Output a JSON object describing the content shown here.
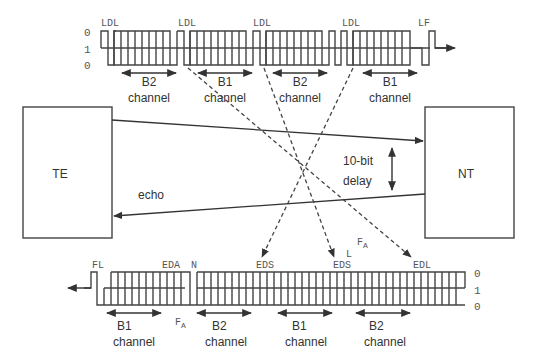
{
  "diagram": {
    "title": "",
    "blocks": {
      "te": {
        "label": "TE"
      },
      "nt": {
        "label": "NT"
      }
    },
    "annotations": {
      "echo": "echo",
      "delay_line1": "10-bit",
      "delay_line2": "delay"
    },
    "top_frame": {
      "direction": "TE to NT",
      "level_labels": [
        "0",
        "1",
        "0"
      ],
      "markers": [
        "LDL",
        "LDL",
        "LDL",
        "LDL",
        "LF"
      ],
      "channels": [
        {
          "name": "B2",
          "sub": "channel"
        },
        {
          "name": "B1",
          "sub": "channel"
        },
        {
          "name": "B2",
          "sub": "channel"
        },
        {
          "name": "B1",
          "sub": "channel"
        }
      ]
    },
    "bottom_frame": {
      "direction": "NT to TE",
      "level_labels": [
        "0",
        "1",
        "0"
      ],
      "markers": [
        "FL",
        "EDA",
        "N",
        "EDS",
        "EDS",
        "L",
        "EDL"
      ],
      "fa_labels": [
        "F",
        "A"
      ],
      "channels": [
        {
          "name": "B1",
          "sub": "channel"
        },
        {
          "name": "B2",
          "sub": "channel"
        },
        {
          "name": "B1",
          "sub": "channel"
        },
        {
          "name": "B2",
          "sub": "channel"
        }
      ]
    },
    "fa_mid": {
      "main": "F",
      "sub": "A"
    },
    "colors": {
      "line": "#444444",
      "text": "#333333",
      "background": "#ffffff"
    }
  }
}
